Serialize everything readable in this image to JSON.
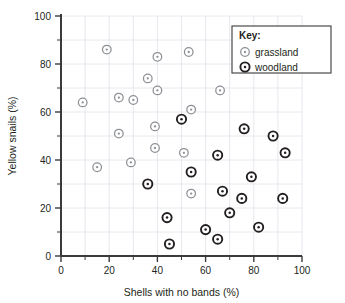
{
  "chart_data": {
    "type": "scatter",
    "title": "",
    "xlabel": "Shells with no bands (%)",
    "ylabel": "Yellow snails (%)",
    "xlim": [
      0,
      100
    ],
    "ylim": [
      0,
      100
    ],
    "xticks": [
      0,
      20,
      40,
      60,
      80,
      100
    ],
    "yticks": [
      0,
      20,
      40,
      60,
      80,
      100
    ],
    "xtick_labels": [
      "0",
      "20",
      "40",
      "60",
      "80",
      "100"
    ],
    "ytick_labels": [
      "0",
      "20",
      "40",
      "60",
      "80",
      "100"
    ],
    "minor_tick_step": 10,
    "grid": true,
    "legend_position": "top-right",
    "legend_title": "Key:",
    "series": [
      {
        "name": "grassland",
        "marker": "open-circle-light",
        "color": "#8e9096",
        "points": [
          {
            "x": 9,
            "y": 64
          },
          {
            "x": 15,
            "y": 37
          },
          {
            "x": 19,
            "y": 86
          },
          {
            "x": 24,
            "y": 66
          },
          {
            "x": 24,
            "y": 51
          },
          {
            "x": 29,
            "y": 39
          },
          {
            "x": 30,
            "y": 65
          },
          {
            "x": 36,
            "y": 74
          },
          {
            "x": 39,
            "y": 45
          },
          {
            "x": 39,
            "y": 54
          },
          {
            "x": 40,
            "y": 83
          },
          {
            "x": 40,
            "y": 69
          },
          {
            "x": 51,
            "y": 43
          },
          {
            "x": 53,
            "y": 85
          },
          {
            "x": 54,
            "y": 61
          },
          {
            "x": 54,
            "y": 26
          },
          {
            "x": 66,
            "y": 69
          }
        ]
      },
      {
        "name": "woodland",
        "marker": "open-circle-dark",
        "color": "#231f20",
        "points": [
          {
            "x": 36,
            "y": 30
          },
          {
            "x": 44,
            "y": 16
          },
          {
            "x": 45,
            "y": 5
          },
          {
            "x": 50,
            "y": 57
          },
          {
            "x": 54,
            "y": 35
          },
          {
            "x": 60,
            "y": 11
          },
          {
            "x": 65,
            "y": 42
          },
          {
            "x": 65,
            "y": 7
          },
          {
            "x": 67,
            "y": 27
          },
          {
            "x": 70,
            "y": 18
          },
          {
            "x": 75,
            "y": 24
          },
          {
            "x": 76,
            "y": 53
          },
          {
            "x": 79,
            "y": 33
          },
          {
            "x": 82,
            "y": 12
          },
          {
            "x": 88,
            "y": 50
          },
          {
            "x": 92,
            "y": 24
          },
          {
            "x": 93,
            "y": 43
          }
        ]
      }
    ]
  },
  "legend": {
    "title": "Key:",
    "entries": [
      {
        "label": "grassland",
        "marker": "open-circle-light"
      },
      {
        "label": "woodland",
        "marker": "open-circle-dark"
      }
    ]
  },
  "colors": {
    "axis": "#3b3b3b",
    "grid": "#e6e8ee",
    "grassland": "#8e9096",
    "woodland": "#231f20",
    "text": "#231f20",
    "legend_border": "#4a4a4a",
    "background": "#ffffff"
  }
}
